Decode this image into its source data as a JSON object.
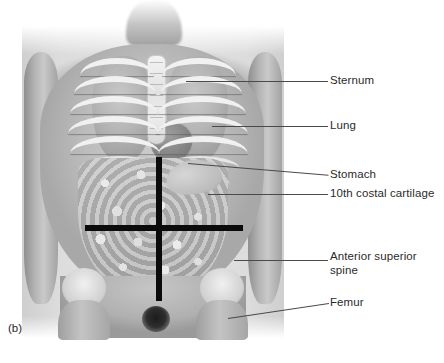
{
  "figure": {
    "caption": "(b)"
  },
  "labels": [
    {
      "id": "sternum",
      "text": "Sternum",
      "leader_y": 81,
      "text_x": 330,
      "text_y": 74
    },
    {
      "id": "lung",
      "text": "Lung",
      "leader_y": 126,
      "text_x": 330,
      "text_y": 119
    },
    {
      "id": "stomach",
      "text": "Stomach",
      "leader_y": 175,
      "text_x": 330,
      "text_y": 168
    },
    {
      "id": "costal-cartilage",
      "text": "10th costal cartilage",
      "leader_y": 194,
      "text_x": 330,
      "text_y": 187
    },
    {
      "id": "anterior-superior-spine",
      "text": "Anterior superior\nspine",
      "leader_y": 260,
      "text_x": 330,
      "text_y": 250
    },
    {
      "id": "femur",
      "text": "Femur",
      "leader_y": 303,
      "text_x": 330,
      "text_y": 296
    }
  ],
  "quadrant_lines": {
    "vertical_label": "median vertical plane",
    "horizontal_label": "transumbilical horizontal plane",
    "color": "#0b0b0b"
  },
  "colors": {
    "background": "#ffffff",
    "text": "#2b2b2b",
    "leader": "#4a4a4a",
    "quadrant": "#0b0b0b",
    "photo_field": "#dcdcdc"
  }
}
